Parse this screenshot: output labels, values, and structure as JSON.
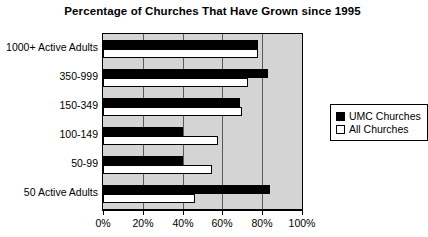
{
  "chart_data": {
    "type": "bar",
    "orientation": "horizontal",
    "title": "Percentage of Churches That Have Grown since 1995",
    "xlabel": "",
    "ylabel": "",
    "categories": [
      "1000+ Active Adults",
      "350-999",
      "150-349",
      "100-149",
      "50-99",
      "50 Active Adults"
    ],
    "series": [
      {
        "name": "UMC Churches",
        "values": [
          78,
          83,
          69,
          40,
          40,
          84
        ],
        "color": "#000000"
      },
      {
        "name": "All Churches",
        "values": [
          78,
          73,
          70,
          58,
          55,
          46
        ],
        "color": "#ffffff"
      }
    ],
    "xlim": [
      0,
      100
    ],
    "xticks": [
      0,
      20,
      40,
      60,
      80,
      100
    ],
    "xtick_labels": [
      "0%",
      "20%",
      "40%",
      "60%",
      "80%",
      "100%"
    ],
    "grid": true,
    "legend_position": "right",
    "plot_background": "#d4d4d4"
  },
  "legend": {
    "items": [
      {
        "label": "UMC Churches",
        "swatch": "filled-square-icon"
      },
      {
        "label": "All Churches",
        "swatch": "empty-square-icon"
      }
    ]
  }
}
